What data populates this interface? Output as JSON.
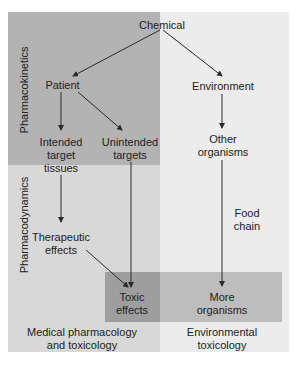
{
  "colors": {
    "pharmacokinetics_band": "#b3b3b3",
    "pharmacodynamics_band": "#d8d8d8",
    "environment_band": "#ececec",
    "outcome_band": "#bdbdbd",
    "toxic_box": "#9e9e9e",
    "arrow": "#2a2a2a"
  },
  "nodes": {
    "chemical": "Chemical",
    "patient": "Patient",
    "environment": "Environment",
    "intended_line1": "Intended",
    "intended_line2": "target",
    "intended_line3": "tissues",
    "unintended_line1": "Unintended",
    "unintended_line2": "targets",
    "other_line1": "Other",
    "other_line2": "organisms",
    "therapeutic_line1": "Therapeutic",
    "therapeutic_line2": "effects",
    "toxic_line1": "Toxic",
    "toxic_line2": "effects",
    "more_line1": "More",
    "more_line2": "organisms",
    "food_line1": "Food",
    "food_line2": "chain"
  },
  "side_labels": {
    "pharmacokinetics": "Pharmacokinetics",
    "pharmacodynamics": "Pharmacodynamics"
  },
  "footer": {
    "medical_line1": "Medical pharmacology",
    "medical_line2": "and toxicology",
    "environmental_line1": "Environmental",
    "environmental_line2": "toxicology"
  }
}
